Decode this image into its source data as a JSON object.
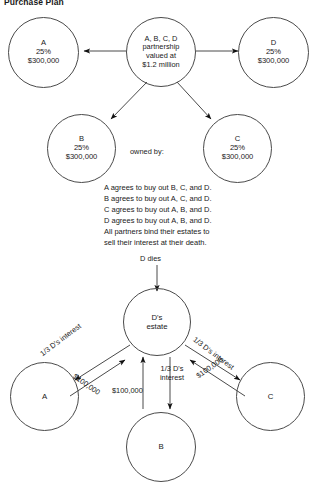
{
  "title": "Purchase Plan",
  "top_diagram": {
    "center_node": {
      "name": "partnership-node",
      "lines": [
        "A, B, C, D",
        "partnership",
        "valued at",
        "$1.2 million"
      ]
    },
    "partners": [
      {
        "name": "partner-a",
        "lines": [
          "A",
          "25%",
          "$300,000"
        ]
      },
      {
        "name": "partner-d",
        "lines": [
          "D",
          "25%",
          "$300,000"
        ]
      },
      {
        "name": "partner-b",
        "lines": [
          "B",
          "25%",
          "$300,000"
        ]
      },
      {
        "name": "partner-c",
        "lines": [
          "C",
          "25%",
          "$300,000"
        ]
      }
    ],
    "owned_by_label": "owned by:"
  },
  "agreement_text": [
    "A agrees to buy out B, C, and D.",
    "B agrees to buy out A, C, and D.",
    "C agrees to buy out A, B, and D.",
    "D agrees to buy out A, B, and D.",
    "All partners bind their estates to",
    "sell their interest at their death."
  ],
  "bottom_diagram": {
    "d_dies_label": "D dies",
    "estate_node": {
      "name": "d-estate-node",
      "lines": [
        "D's",
        "estate"
      ]
    },
    "buyers": [
      {
        "name": "buyer-a",
        "label": "A"
      },
      {
        "name": "buyer-b",
        "label": "B"
      },
      {
        "name": "buyer-c",
        "label": "C"
      }
    ],
    "edge_labels": {
      "left_interest": "1/3 D's interest",
      "left_money": "$100,000",
      "right_interest": "1/3 D's interest",
      "right_money": "$100,000",
      "center_interest_line1": "1/3 D's",
      "center_interest_line2": "interest",
      "center_money": "$100,000"
    }
  },
  "style": {
    "stroke": "#4a4a4a",
    "arrow": "#111111",
    "text": "#1a1a1a"
  }
}
